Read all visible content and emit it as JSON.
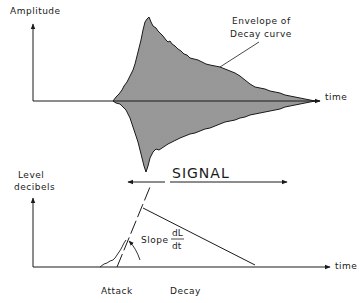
{
  "top_plot": {
    "y_axis_label": "Amplitude",
    "x_axis_label": "time",
    "annotation_line1": "Envelope of",
    "annotation_line2": "Decay curve"
  },
  "signal": {
    "label": "SIGNAL"
  },
  "bottom_plot": {
    "y_axis_label_line1": "Level",
    "y_axis_label_line2": "decibels",
    "x_axis_label": "time",
    "slope_label": "Slope",
    "slope_numerator": "dL",
    "slope_denominator": "dt"
  },
  "phases": {
    "attack_label": "Attack",
    "decay_label": "Decay"
  },
  "colors": {
    "ink": "#1a1a1a",
    "background": "#ffffff"
  }
}
